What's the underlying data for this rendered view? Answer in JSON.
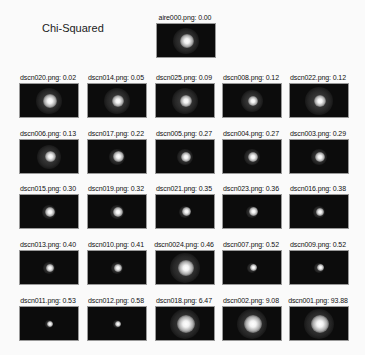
{
  "title": "Chi-Squared",
  "reference": {
    "label": "aire000.png: 0.00",
    "halo": 26,
    "core": 14,
    "cx": 0.5,
    "cy": 0.5
  },
  "rows": [
    [
      {
        "label": "dscn020.png: 0.02",
        "halo": 26,
        "core": 14
      },
      {
        "label": "dscn014.png: 0.05",
        "halo": 26,
        "core": 12
      },
      {
        "label": "dscn025.png: 0.09",
        "halo": 26,
        "core": 12
      },
      {
        "label": "dscn008.png: 0.12",
        "halo": 22,
        "core": 10
      },
      {
        "label": "dscn022.png: 0.12",
        "halo": 28,
        "core": 12
      }
    ],
    [
      {
        "label": "dscn006.png: 0.13",
        "halo": 24,
        "core": 11
      },
      {
        "label": "dscn017.png: 0.22",
        "halo": 16,
        "core": 11
      },
      {
        "label": "dscn005.png: 0.27",
        "halo": 16,
        "core": 10
      },
      {
        "label": "dscn004.png: 0.27",
        "halo": 16,
        "core": 10
      },
      {
        "label": "dscn003.png: 0.29",
        "halo": 16,
        "core": 10
      }
    ],
    [
      {
        "label": "dscn015.png: 0.30",
        "halo": 14,
        "core": 10
      },
      {
        "label": "dscn019.png: 0.32",
        "halo": 14,
        "core": 10
      },
      {
        "label": "dscn021.png: 0.35",
        "halo": 12,
        "core": 9
      },
      {
        "label": "dscn023.png: 0.36",
        "halo": 12,
        "core": 9
      },
      {
        "label": "dscn016.png: 0.38",
        "halo": 12,
        "core": 8
      }
    ],
    [
      {
        "label": "dscn013.png: 0.40",
        "halo": 12,
        "core": 8
      },
      {
        "label": "dscn010.png: 0.41",
        "halo": 12,
        "core": 8
      },
      {
        "label": "dscn0024.png: 0.46",
        "halo": 30,
        "core": 16
      },
      {
        "label": "dscn007.png: 0.52",
        "halo": 10,
        "core": 7
      },
      {
        "label": "dscn009.png: 0.52",
        "halo": 10,
        "core": 7
      }
    ],
    [
      {
        "label": "dscn011.png: 0.53",
        "halo": 8,
        "core": 6
      },
      {
        "label": "dscn012.png: 0.58",
        "halo": 8,
        "core": 6
      },
      {
        "label": "dscn018.png: 6.47",
        "halo": 30,
        "core": 18
      },
      {
        "label": "dscn002.png: 9.08",
        "halo": 30,
        "core": 18
      },
      {
        "label": "dscn001.png: 93.88",
        "halo": 30,
        "core": 18
      }
    ]
  ]
}
